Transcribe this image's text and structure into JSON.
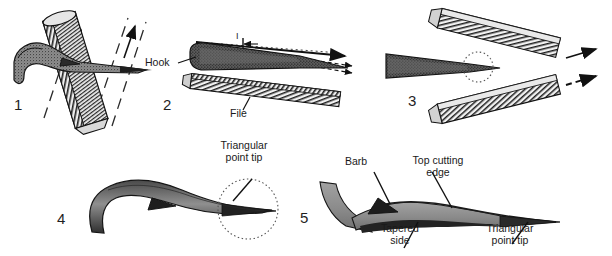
{
  "figure": {
    "background_color": "#ffffff",
    "ink_color": "#1a1a1a",
    "metal_light": "#9a9a9a",
    "metal_dark": "#3a3a3a",
    "width": 612,
    "height": 256
  },
  "panels": [
    {
      "number": "1",
      "caption": "",
      "labels": [],
      "icon": "hook-and-file-crossed-icon"
    },
    {
      "number": "2",
      "caption": "",
      "labels": [
        {
          "key": "hook",
          "text": "Hook"
        },
        {
          "key": "file",
          "text": "File"
        }
      ],
      "icon": "hook-above-file-icon"
    },
    {
      "number": "3",
      "caption": "",
      "labels": [],
      "icon": "hook-between-two-files-icon"
    },
    {
      "number": "4",
      "caption": "",
      "labels": [
        {
          "key": "triangular_point_tip",
          "text": "Triangular\npoint tip",
          "line1": "Triangular",
          "line2": "point tip"
        }
      ],
      "icon": "sharpened-hook-side-view-icon"
    },
    {
      "number": "5",
      "caption": "",
      "labels": [
        {
          "key": "barb",
          "text": "Barb"
        },
        {
          "key": "top_cutting_edge",
          "text": "Top cutting\nedge",
          "line1": "Top cutting",
          "line2": "edge"
        },
        {
          "key": "tapered_side",
          "text": "Tapered\nside",
          "line1": "Tapered",
          "line2": "side"
        },
        {
          "key": "triangular_point_tip",
          "text": "Triangular\npoint tip",
          "line1": "Triangular",
          "line2": "point tip"
        }
      ],
      "icon": "finished-hook-detail-icon"
    }
  ],
  "annotations": {
    "panel1_arrows": [
      "stroke-arrow-up-left",
      "stroke-arrow-up-right"
    ],
    "panel2_dimension": "I",
    "panel3_arrows": [
      "solid-arrow-right",
      "dashed-arrow-right"
    ]
  },
  "numbers": {
    "p1": "1",
    "p2": "2",
    "p3": "3",
    "p4": "4",
    "p5": "5"
  },
  "labels": {
    "hook": "Hook",
    "file": "File",
    "dimension_mark": "I",
    "triangular_l1": "Triangular",
    "triangular_l2": "point tip",
    "barb": "Barb",
    "topcut_l1": "Top cutting",
    "topcut_l2": "edge",
    "tapered_l1": "Tapered",
    "tapered_l2": "side",
    "tri5_l1": "Triangular",
    "tri5_l2": "point tip"
  }
}
